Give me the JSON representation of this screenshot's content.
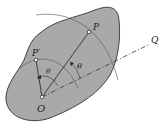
{
  "diagram": {
    "labels": {
      "O": "O",
      "P": "P",
      "P_prime": "P′",
      "Q": "Q",
      "theta": "θ",
      "theta_prime": "θ′"
    },
    "colors": {
      "body_fill": "#a9a9a9",
      "body_stroke": "#333333",
      "line": "#222222",
      "arc": "#555555"
    }
  }
}
